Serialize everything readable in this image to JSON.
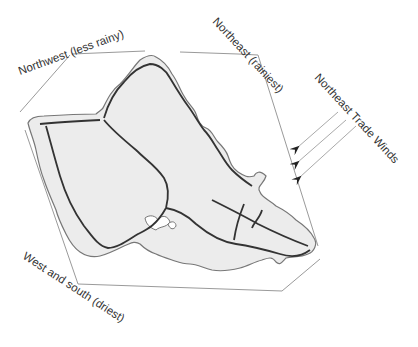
{
  "diagram": {
    "labels": {
      "northwest": "Northwest (less rainy)",
      "northeast": "Northeast (rainiest)",
      "west_south": "West and south (driest)",
      "trade_winds": "Northeast Trade Winds"
    },
    "regions": [
      {
        "name": "Northwest",
        "rainfall": "less rainy"
      },
      {
        "name": "Northeast",
        "rainfall": "rainiest"
      },
      {
        "name": "West and south",
        "rainfall": "driest"
      }
    ],
    "wind": {
      "direction": "from northeast",
      "arrow_count": 3
    },
    "colors": {
      "island_fill": "#ececec",
      "coastline": "#777777",
      "ridge_lines": "#333333",
      "frame": "#9a9a9a",
      "text": "#333333"
    }
  }
}
